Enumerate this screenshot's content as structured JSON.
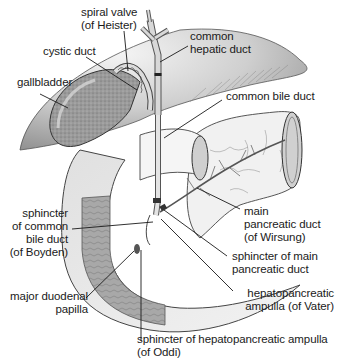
{
  "diagram": {
    "title": "",
    "colors": {
      "background": "#ffffff",
      "liver_dark": "#8a8a8a",
      "liver_light": "#e6e6e6",
      "organ_fill": "#efefef",
      "duodenum_wall": "#9a9a9a",
      "line": "#1a1a1a",
      "text": "#1a1a1a"
    },
    "labels": {
      "spiral_valve": {
        "line1": "spiral valve",
        "line2": "(of Heister)"
      },
      "common_hepatic_duct": {
        "line1": "common",
        "line2": "hepatic duct"
      },
      "cystic_duct": {
        "line1": "cystic duct"
      },
      "gallbladder": {
        "line1": "gallbladder"
      },
      "common_bile_duct": {
        "line1": "common bile duct"
      },
      "main_pancreatic_duct": {
        "line1": "main",
        "line2": "pancreatic duct",
        "line3": "(of Wirsung)"
      },
      "sphincter_common_bile_duct": {
        "line1": "sphincter",
        "line2": "of common",
        "line3": "bile duct",
        "line4": "(of Boyden)"
      },
      "sphincter_main_pancreatic_duct": {
        "line1": "sphincter of main",
        "line2": "pancreatic duct"
      },
      "hepatopancreatic_ampulla": {
        "line1": "hepatopancreatic",
        "line2": "ampulla (of Vater)"
      },
      "major_duodenal_papilla": {
        "line1": "major duodenal",
        "line2": "papilla"
      },
      "sphincter_hepatopancreatic_ampulla": {
        "line1": "sphincter of hepatopancreatic ampulla",
        "line2": "(of Oddi)"
      }
    }
  }
}
